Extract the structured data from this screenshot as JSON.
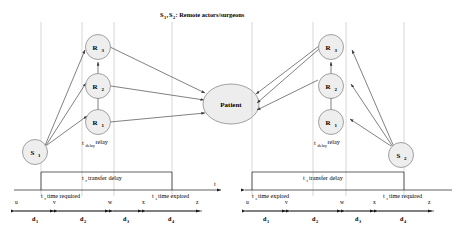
{
  "figure": {
    "title_parts": {
      "s1": "S",
      "s1_sub": "1",
      "comma": ",",
      "s2": "S",
      "s2_sub": "2",
      "rest": " : Remote actors/surgeons"
    },
    "background": "#ffffff",
    "node_fill": "#eeeeee",
    "node_stroke": "#8a8a8a",
    "edge_color": "#4a4a4a",
    "guide_color": "#bdbdbd",
    "axis_color": "#3a3a3a"
  },
  "panels": [
    {
      "id": "left",
      "source_node": {
        "label": "S",
        "sub": "1",
        "name": "S1"
      },
      "relay_nodes": [
        {
          "label": "R",
          "sub": "3",
          "name": "R3"
        },
        {
          "label": "R",
          "sub": "2",
          "name": "R2"
        },
        {
          "label": "R",
          "sub": "1",
          "name": "R1"
        }
      ],
      "target_node": {
        "label": "Patient",
        "name": "Patient"
      },
      "relay_caption": {
        "base": "t",
        "sub": "delay",
        "text": " relay"
      },
      "transfer_caption": {
        "base": "t",
        "sub": "r",
        "text": " transfer delay"
      },
      "left_caption": {
        "base": "t",
        "sub": "r",
        "text": " time required"
      },
      "right_caption": {
        "base": "t",
        "sub": "e",
        "text": " time expired"
      },
      "axis_arrow_label": "t",
      "markers": [
        "u",
        "v",
        "w",
        "x",
        "z"
      ],
      "segments": [
        {
          "label": "d",
          "sub": "1"
        },
        {
          "label": "d",
          "sub": "2"
        },
        {
          "label": "d",
          "sub": "3"
        },
        {
          "label": "d",
          "sub": "4"
        }
      ]
    },
    {
      "id": "right",
      "source_node": {
        "label": "S",
        "sub": "2",
        "name": "S2"
      },
      "relay_nodes": [
        {
          "label": "R",
          "sub": "3",
          "name": "R3"
        },
        {
          "label": "R",
          "sub": "2",
          "name": "R2"
        },
        {
          "label": "R",
          "sub": "1",
          "name": "R1"
        }
      ],
      "target_node": {
        "label": "Patient",
        "name": "Patient"
      },
      "relay_caption": {
        "base": "t",
        "sub": "delay",
        "text": " relay"
      },
      "transfer_caption": {
        "base": "t",
        "sub": "r",
        "text": " transfer delay"
      },
      "left_caption": {
        "base": "t",
        "sub": "e",
        "text": " time expired"
      },
      "right_caption": {
        "base": "t",
        "sub": "r",
        "text": " time required"
      },
      "axis_arrow_label": "",
      "markers": [
        "u",
        "v",
        "w",
        "x",
        "z"
      ],
      "segments": [
        {
          "label": "d",
          "sub": "1"
        },
        {
          "label": "d",
          "sub": "2"
        },
        {
          "label": "d",
          "sub": "3"
        },
        {
          "label": "d",
          "sub": "4"
        }
      ]
    }
  ]
}
